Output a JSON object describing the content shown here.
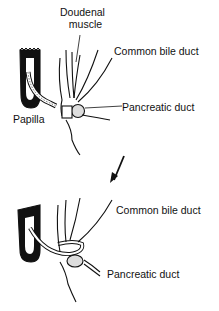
{
  "diagram": {
    "panels": [
      {
        "id": "before",
        "labels": {
          "doudenal_muscle_line1": "Doudenal",
          "doudenal_muscle_line2": "muscle",
          "common_bile_duct": "Common bile duct",
          "pancreatic_duct": "Pancreatic duct",
          "papilla": "Papilla"
        }
      },
      {
        "id": "after",
        "labels": {
          "common_bile_duct": "Common bile duct",
          "pancreatic_duct": "Pancreatic duct"
        }
      }
    ],
    "transition_arrow": "arrow-down-left",
    "colors": {
      "ink": "#111111",
      "background": "#ffffff"
    }
  }
}
